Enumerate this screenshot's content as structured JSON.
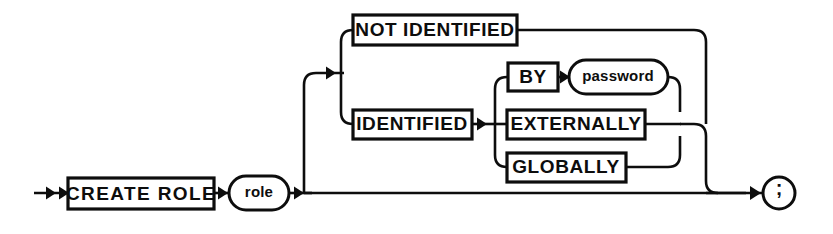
{
  "diagram": {
    "title": "CREATE ROLE",
    "type": "railroad-syntax-diagram",
    "colors": {
      "ink": "#0d0d0d",
      "background": "#ffffff"
    },
    "nodes": {
      "create_role": {
        "label": "CREATE ROLE",
        "shape": "box",
        "kind": "keyword"
      },
      "role": {
        "label": "role",
        "shape": "oval",
        "kind": "variable"
      },
      "not_identified": {
        "label": "NOT IDENTIFIED",
        "shape": "box",
        "kind": "keyword"
      },
      "identified": {
        "label": "IDENTIFIED",
        "shape": "box",
        "kind": "keyword"
      },
      "by": {
        "label": "BY",
        "shape": "box",
        "kind": "keyword"
      },
      "password": {
        "label": "password",
        "shape": "oval",
        "kind": "variable"
      },
      "externally": {
        "label": "EXTERNALLY",
        "shape": "box",
        "kind": "keyword"
      },
      "globally": {
        "label": "GLOBALLY",
        "shape": "box",
        "kind": "keyword"
      },
      "terminator": {
        "label": ";",
        "shape": "circle",
        "kind": "terminator"
      }
    }
  }
}
